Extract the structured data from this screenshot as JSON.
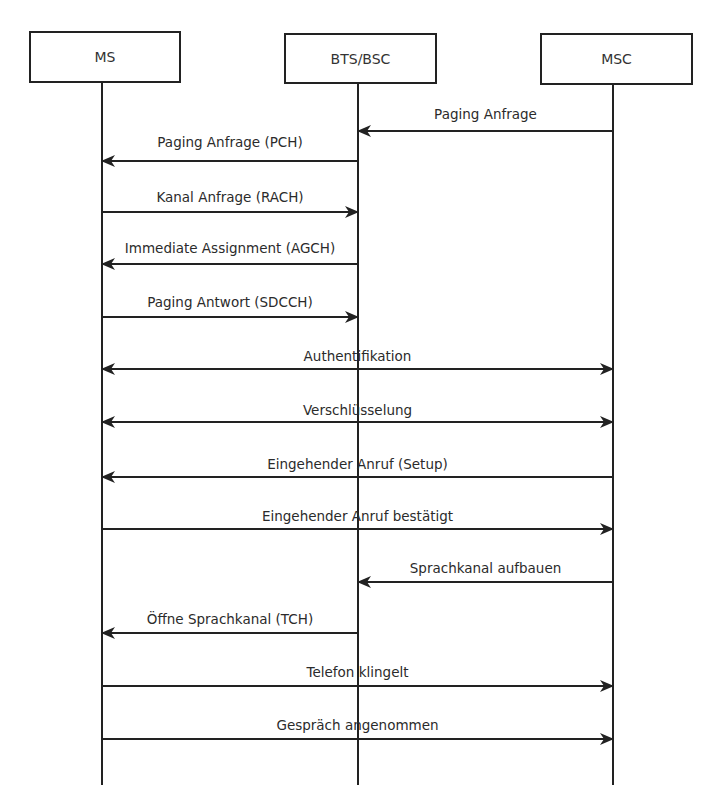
{
  "diagram": {
    "type": "sequence",
    "participants": [
      {
        "id": "ms",
        "label": "MS",
        "x": 102,
        "box": {
          "left": 29,
          "top": 31,
          "width": 152,
          "height": 52
        }
      },
      {
        "id": "bts",
        "label": "BTS/BSC",
        "x": 358,
        "box": {
          "left": 284,
          "top": 33,
          "width": 153,
          "height": 51
        }
      },
      {
        "id": "msc",
        "label": "MSC",
        "x": 613,
        "box": {
          "left": 540,
          "top": 33,
          "width": 153,
          "height": 52
        }
      }
    ],
    "lifeline_bottom": 785,
    "messages": [
      {
        "label": "Paging Anfrage",
        "from": "msc",
        "to": "bts",
        "y": 131,
        "label_y": 106,
        "direction": "left"
      },
      {
        "label": "Paging Anfrage (PCH)",
        "from": "bts",
        "to": "ms",
        "y": 161,
        "label_y": 134,
        "direction": "left"
      },
      {
        "label": "Kanal Anfrage (RACH)",
        "from": "ms",
        "to": "bts",
        "y": 212,
        "label_y": 189,
        "direction": "right"
      },
      {
        "label": "Immediate Assignment (AGCH)",
        "from": "bts",
        "to": "ms",
        "y": 264,
        "label_y": 240,
        "direction": "left"
      },
      {
        "label": "Paging Antwort (SDCCH)",
        "from": "ms",
        "to": "bts",
        "y": 317,
        "label_y": 294,
        "direction": "right"
      },
      {
        "label": "Authentifikation",
        "from": "ms",
        "to": "msc",
        "y": 369,
        "label_y": 348,
        "direction": "both"
      },
      {
        "label": "Verschlüsselung",
        "from": "ms",
        "to": "msc",
        "y": 422,
        "label_y": 402,
        "direction": "both"
      },
      {
        "label": "Eingehender Anruf (Setup)",
        "from": "msc",
        "to": "ms",
        "y": 477,
        "label_y": 456,
        "direction": "left"
      },
      {
        "label": "Eingehender Anruf bestätigt",
        "from": "ms",
        "to": "msc",
        "y": 529,
        "label_y": 508,
        "direction": "right"
      },
      {
        "label": "Sprachkanal aufbauen",
        "from": "msc",
        "to": "bts",
        "y": 582,
        "label_y": 560,
        "direction": "left"
      },
      {
        "label": "Öffne Sprachkanal (TCH)",
        "from": "bts",
        "to": "ms",
        "y": 633,
        "label_y": 611,
        "direction": "left"
      },
      {
        "label": "Telefon klingelt",
        "from": "ms",
        "to": "msc",
        "y": 686,
        "label_y": 664,
        "direction": "right"
      },
      {
        "label": "Gespräch angenommen",
        "from": "ms",
        "to": "msc",
        "y": 739,
        "label_y": 717,
        "direction": "right"
      }
    ]
  },
  "colors": {
    "line": "#222222",
    "text": "#2b2b2b",
    "background": "#ffffff"
  }
}
